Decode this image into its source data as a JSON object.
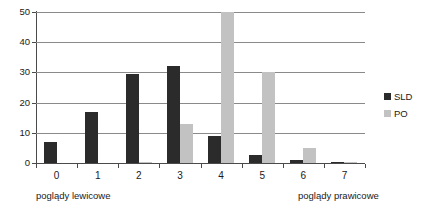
{
  "chart_data": {
    "type": "bar",
    "title": "",
    "subtitle": "",
    "xlabel": "",
    "ylabel": "",
    "categories": [
      "0",
      "1",
      "2",
      "3",
      "4",
      "5",
      "6",
      "7"
    ],
    "series": [
      {
        "name": "SLD",
        "color": "#2b2b2b",
        "values": [
          7,
          17,
          29.5,
          32,
          9,
          2.5,
          1,
          0.3
        ]
      },
      {
        "name": "PO",
        "color": "#c2c2c2",
        "values": [
          0,
          0,
          0.3,
          13,
          50,
          30,
          5,
          0.4
        ]
      }
    ],
    "ylim": [
      0,
      50
    ],
    "yticks": [
      0,
      10,
      20,
      30,
      40,
      50
    ],
    "ytick_labels": [
      "0",
      "10",
      "20",
      "30",
      "40",
      "50"
    ],
    "grid": true,
    "legend_position": "right",
    "annotations": {
      "left_axis_caption": "poglądy lewicowe",
      "right_axis_caption": "poglądy prawicowe"
    }
  },
  "legend": {
    "items": [
      {
        "label": "SLD"
      },
      {
        "label": "PO"
      }
    ]
  },
  "captions": {
    "left": "poglądy lewicowe",
    "right": "poglądy prawicowe"
  }
}
